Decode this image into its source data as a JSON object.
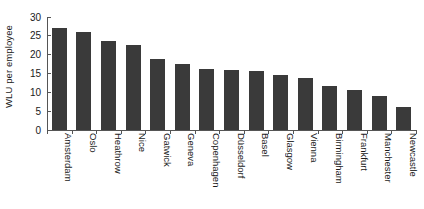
{
  "chart_data": {
    "type": "bar",
    "title": "",
    "subtitle": "",
    "xlabel": "",
    "ylabel": "WLU per employee",
    "ylim": [
      0,
      30
    ],
    "yticks": [
      0,
      5,
      10,
      15,
      20,
      25,
      30
    ],
    "ytick_labels": [
      "0",
      "5",
      "10",
      "15",
      "20",
      "25",
      "30"
    ],
    "grid": false,
    "legend": null,
    "bar_color": "#3a3a3a",
    "background_color": "#ffffff",
    "axis_color": "#555555",
    "categories": [
      "Amsterdam",
      "Oslo",
      "Heathrow",
      "Nice",
      "Gatwick",
      "Geneva",
      "Copenhagen",
      "Düsseldorf",
      "Basel",
      "Glasgow",
      "Vienna",
      "Birmingham",
      "Frankfurt",
      "Manchester",
      "Newcastle"
    ],
    "values": [
      27.0,
      25.9,
      23.5,
      22.7,
      18.8,
      17.4,
      16.2,
      16.0,
      15.6,
      14.6,
      13.9,
      11.6,
      10.7,
      9.1,
      6.2
    ]
  }
}
